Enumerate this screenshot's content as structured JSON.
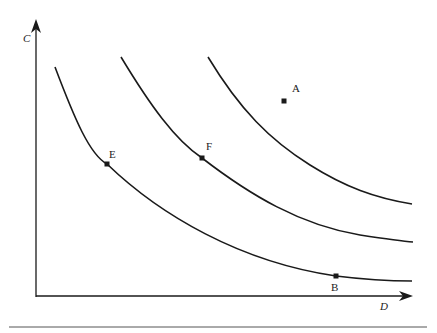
{
  "diagram": {
    "type": "indifference-curves",
    "axes": {
      "x_label": "D",
      "y_label": "C"
    },
    "curves": [
      {
        "name": "lower-curve",
        "points": [
          "E",
          "B"
        ]
      },
      {
        "name": "middle-curve",
        "points": [
          "F"
        ]
      },
      {
        "name": "upper-curve",
        "points": []
      }
    ],
    "points": [
      {
        "label": "A",
        "x": 284,
        "y": 101
      },
      {
        "label": "B",
        "x": 336,
        "y": 276
      },
      {
        "label": "E",
        "x": 107,
        "y": 164
      },
      {
        "label": "F",
        "x": 202,
        "y": 158
      }
    ],
    "colors": {
      "line": "#1a1a1a",
      "rule": "#555555"
    }
  }
}
